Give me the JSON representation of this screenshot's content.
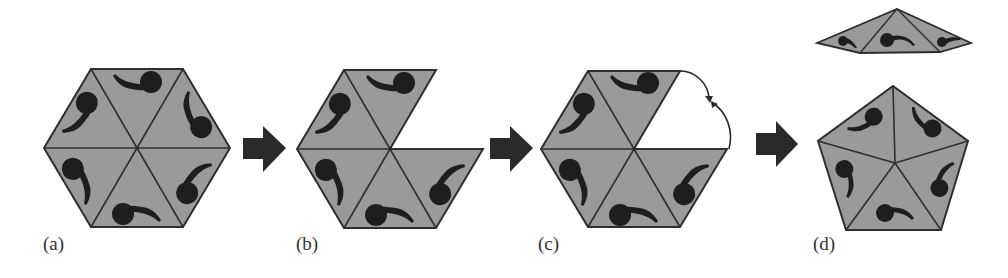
{
  "figure": {
    "panels": [
      {
        "id": "a",
        "label": "(a)",
        "description": "Hexagon made of six triangles, each with a comma-shaped motif"
      },
      {
        "id": "b",
        "label": "(b)",
        "description": "Hexagon with one triangle removed"
      },
      {
        "id": "c",
        "label": "(c)",
        "description": "Gap closed by rotating adjacent edges together (curved arrows)"
      },
      {
        "id": "d",
        "label": "(d)",
        "description": "Resulting pentagon of five triangles; removed triangle shown flattened above"
      }
    ],
    "colors": {
      "tile_fill": "#9a9a9a",
      "edge": "#2e2e2e",
      "motif": "#1e1e1e",
      "arrow": "#2a2a2a",
      "background": "#ffffff"
    }
  }
}
